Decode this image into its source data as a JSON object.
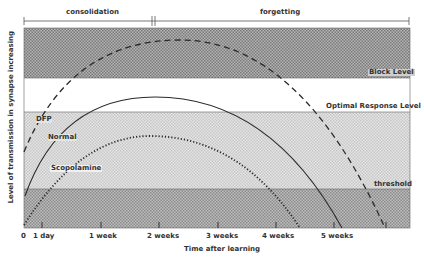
{
  "diagram": {
    "phases": {
      "consolidation": "consolidation",
      "forgetting": "forgetting"
    },
    "levels": {
      "block": "Block Level",
      "optimal": "Optimal Response Level",
      "threshold": "threshold"
    },
    "curves": {
      "dfp": "DFP",
      "normal": "Normal",
      "scopolamine": "Scopolamine"
    },
    "axes": {
      "ylabel": "Level of transmission in synapse increasing",
      "xlabel": "Time after learning",
      "xticks": [
        "0",
        "1 day",
        "1 week",
        "2 weeks",
        "3 weeks",
        "4 weeks",
        "5 weeks"
      ]
    },
    "colors": {
      "block_band": "#9a9a9a",
      "optimal_band": "#ffffff",
      "response_band": "#d6d6d6",
      "subthreshold_band": "#a8a8a8",
      "line": "#2a2a2a"
    }
  }
}
